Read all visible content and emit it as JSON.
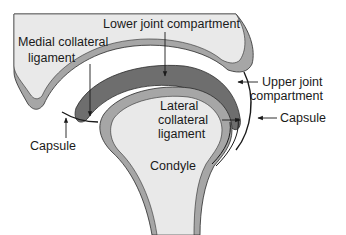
{
  "diagram": {
    "labels": {
      "lower_joint_compartment": "Lower joint compartment",
      "medial_collateral_ligament_line1": "Medial collateral",
      "medial_collateral_ligament_line2": "ligament",
      "upper_joint_compartment_line1": "Upper joint",
      "upper_joint_compartment_line2": "compartment",
      "capsule_right": "Capsule",
      "capsule_left": "Capsule",
      "lateral_collateral_ligament_line1": "Lateral",
      "lateral_collateral_ligament_line2": "collateral",
      "lateral_collateral_ligament_line3": "ligament",
      "condyle": "Condyle"
    },
    "colors": {
      "bone_fill": "#e9e9e9",
      "cortex_gray": "#a6a6a6",
      "disc_dark": "#6e6e6e",
      "outline": "#2b2b2b",
      "text": "#1a1a1a"
    }
  }
}
